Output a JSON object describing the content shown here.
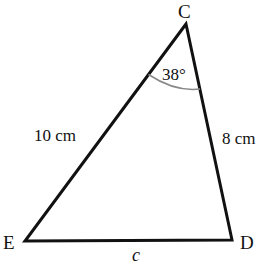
{
  "diagram": {
    "type": "triangle",
    "vertices": [
      {
        "id": "C",
        "label": "C",
        "x": 186,
        "y": 24
      },
      {
        "id": "E",
        "label": "E",
        "x": 25,
        "y": 241
      },
      {
        "id": "D",
        "label": "D",
        "x": 232,
        "y": 240
      }
    ],
    "sides": [
      {
        "from": "C",
        "to": "E",
        "label": "10 cm"
      },
      {
        "from": "C",
        "to": "D",
        "label": "8 cm"
      },
      {
        "from": "E",
        "to": "D",
        "label": "c"
      }
    ],
    "angles": [
      {
        "at": "C",
        "label": "38°"
      }
    ],
    "colors": {
      "lines": "#111111",
      "arc": "#888888",
      "text": "#111111"
    }
  }
}
